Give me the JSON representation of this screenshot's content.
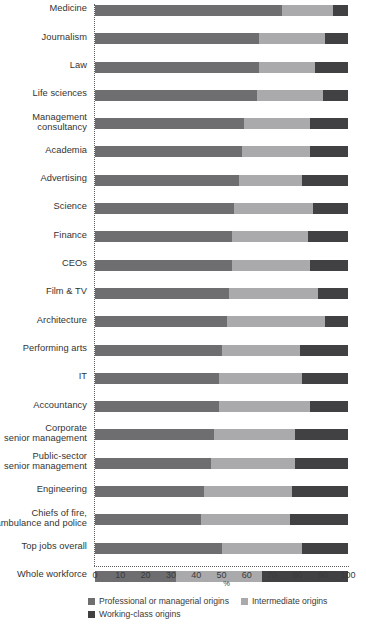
{
  "chart_data": {
    "type": "bar",
    "orientation": "horizontal",
    "stacked": true,
    "title": "",
    "xlabel": "%",
    "ylabel": "",
    "xlim": [
      0,
      100
    ],
    "xticks": [
      0,
      10,
      20,
      30,
      40,
      50,
      60,
      70,
      80,
      90,
      100
    ],
    "grid": false,
    "legend_position": "bottom-left",
    "colors": {
      "professional": "#6e6e70",
      "intermediate": "#aaaaac",
      "working": "#414144"
    },
    "series": [
      {
        "name": "Professional or managerial origins",
        "key": "professional"
      },
      {
        "name": "Intermediate origins",
        "key": "intermediate"
      },
      {
        "name": "Working-class origins",
        "key": "working"
      }
    ],
    "categories": [
      "Medicine",
      "Journalism",
      "Law",
      "Life sciences",
      "Management consultancy",
      "Academia",
      "Advertising",
      "Science",
      "Finance",
      "CEOs",
      "Film & TV",
      "Architecture",
      "Performing arts",
      "IT",
      "Accountancy",
      "Corporate senior management",
      "Public-sector senior management",
      "Engineering",
      "Chiefs of fire, ambulance and police",
      "Top jobs overall",
      "Whole workforce"
    ],
    "rows": [
      {
        "label": "Medicine",
        "label_lines": [
          "Medicine"
        ],
        "professional": 74,
        "intermediate": 20,
        "working": 6
      },
      {
        "label": "Journalism",
        "label_lines": [
          "Journalism"
        ],
        "professional": 65,
        "intermediate": 26,
        "working": 9
      },
      {
        "label": "Law",
        "label_lines": [
          "Law"
        ],
        "professional": 65,
        "intermediate": 22,
        "working": 13
      },
      {
        "label": "Life sciences",
        "label_lines": [
          "Life sciences"
        ],
        "professional": 64,
        "intermediate": 26,
        "working": 10
      },
      {
        "label": "Management consultancy",
        "label_lines": [
          "Management",
          "consultancy"
        ],
        "professional": 59,
        "intermediate": 26,
        "working": 15
      },
      {
        "label": "Academia",
        "label_lines": [
          "Academia"
        ],
        "professional": 58,
        "intermediate": 27,
        "working": 15
      },
      {
        "label": "Advertising",
        "label_lines": [
          "Advertising"
        ],
        "professional": 57,
        "intermediate": 25,
        "working": 18
      },
      {
        "label": "Science",
        "label_lines": [
          "Science"
        ],
        "professional": 55,
        "intermediate": 31,
        "working": 14
      },
      {
        "label": "Finance",
        "label_lines": [
          "Finance"
        ],
        "professional": 54,
        "intermediate": 30,
        "working": 16
      },
      {
        "label": "CEOs",
        "label_lines": [
          "CEOs"
        ],
        "professional": 54,
        "intermediate": 31,
        "working": 15
      },
      {
        "label": "Film & TV",
        "label_lines": [
          "Film & TV"
        ],
        "professional": 53,
        "intermediate": 35,
        "working": 12
      },
      {
        "label": "Architecture",
        "label_lines": [
          "Architecture"
        ],
        "professional": 52,
        "intermediate": 39,
        "working": 9
      },
      {
        "label": "Performing arts",
        "label_lines": [
          "Performing arts"
        ],
        "professional": 50,
        "intermediate": 31,
        "working": 19
      },
      {
        "label": "IT",
        "label_lines": [
          "IT"
        ],
        "professional": 49,
        "intermediate": 33,
        "working": 18
      },
      {
        "label": "Accountancy",
        "label_lines": [
          "Accountancy"
        ],
        "professional": 49,
        "intermediate": 36,
        "working": 15
      },
      {
        "label": "Corporate senior management",
        "label_lines": [
          "Corporate",
          "senior management"
        ],
        "professional": 47,
        "intermediate": 32,
        "working": 21
      },
      {
        "label": "Public-sector senior management",
        "label_lines": [
          "Public-sector",
          "senior management"
        ],
        "professional": 46,
        "intermediate": 33,
        "working": 21
      },
      {
        "label": "Engineering",
        "label_lines": [
          "Engineering"
        ],
        "professional": 43,
        "intermediate": 35,
        "working": 22
      },
      {
        "label": "Chiefs of fire, ambulance and police",
        "label_lines": [
          "Chiefs of fire,",
          "ambulance and police"
        ],
        "professional": 42,
        "intermediate": 35,
        "working": 23
      },
      {
        "label": "Top jobs overall",
        "label_lines": [
          "Top jobs overall"
        ],
        "professional": 50,
        "intermediate": 32,
        "working": 18
      },
      {
        "label": "Whole workforce",
        "label_lines": [
          "Whole workforce"
        ],
        "professional": 32,
        "intermediate": 34,
        "working": 34
      }
    ]
  },
  "axis": {
    "unit_label": "%",
    "tick_labels": [
      "0",
      "10",
      "20",
      "30",
      "40",
      "50",
      "60",
      "70",
      "80",
      "90",
      "100"
    ]
  },
  "legend": {
    "items": [
      {
        "label": "Professional or managerial origins",
        "swatch": "prof"
      },
      {
        "label": "Intermediate origins",
        "swatch": "inter"
      },
      {
        "label": "Working-class origins",
        "swatch": "work"
      }
    ]
  }
}
